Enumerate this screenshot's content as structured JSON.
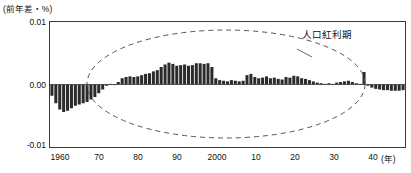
{
  "chart_data": {
    "type": "bar",
    "title": "",
    "subtitle": "",
    "ylabel": "(前年差・%)",
    "xlabel": "(年)",
    "ylim": [
      -0.01,
      0.01
    ],
    "xlim": [
      1960,
      2050
    ],
    "grid": false,
    "legend": null,
    "ytick_labels": [
      "0.01",
      "0.00",
      "-0.01"
    ],
    "ytick_values": [
      0.01,
      0.0,
      -0.01
    ],
    "xtick_labels": [
      "1960",
      "70",
      "80",
      "90",
      "2000",
      "10",
      "20",
      "30",
      "40"
    ],
    "xtick_values": [
      1960,
      1970,
      1980,
      1990,
      2000,
      2010,
      2020,
      2030,
      2040
    ],
    "bar_color": "#2b2b2b",
    "annotations": [
      {
        "text": "人口紅利期",
        "kind": "ellipse-callout",
        "description": "破線の楕円で囲まれた期間（およそ1970年代初頭から2030年頃まで）"
      }
    ],
    "x": [
      1960,
      1961,
      1962,
      1963,
      1964,
      1965,
      1966,
      1967,
      1968,
      1969,
      1970,
      1971,
      1972,
      1973,
      1974,
      1975,
      1976,
      1977,
      1978,
      1979,
      1980,
      1981,
      1982,
      1983,
      1984,
      1985,
      1986,
      1987,
      1988,
      1989,
      1990,
      1991,
      1992,
      1993,
      1994,
      1995,
      1996,
      1997,
      1998,
      1999,
      2000,
      2001,
      2002,
      2003,
      2004,
      2005,
      2006,
      2007,
      2008,
      2009,
      2010,
      2011,
      2012,
      2013,
      2014,
      2015,
      2016,
      2017,
      2018,
      2019,
      2020,
      2021,
      2022,
      2023,
      2024,
      2025,
      2026,
      2027,
      2028,
      2029,
      2030,
      2031,
      2032,
      2033,
      2034,
      2035,
      2036,
      2037,
      2038,
      2039,
      2040,
      2041,
      2042,
      2043,
      2044,
      2045,
      2046,
      2047,
      2048,
      2049,
      2050
    ],
    "values": [
      -0.0018,
      -0.003,
      -0.004,
      -0.0044,
      -0.0042,
      -0.0038,
      -0.0034,
      -0.0032,
      -0.003,
      -0.0028,
      -0.0024,
      -0.002,
      -0.0014,
      -0.0008,
      -0.0002,
      0.0001,
      -0.0001,
      0.0004,
      0.001,
      0.0012,
      0.0013,
      0.0012,
      0.0013,
      0.0015,
      0.0017,
      0.0018,
      0.0021,
      0.0023,
      0.0028,
      0.0032,
      0.0035,
      0.0033,
      0.003,
      0.0031,
      0.0032,
      0.003,
      0.0031,
      0.0034,
      0.0034,
      0.0033,
      0.0034,
      0.0028,
      0.001,
      0.0007,
      0.0006,
      0.0005,
      0.0007,
      0.0006,
      0.0005,
      0.0006,
      0.0015,
      0.0017,
      0.0012,
      0.001,
      0.0011,
      0.0013,
      0.001,
      0.0011,
      0.0009,
      0.0008,
      0.0012,
      0.0011,
      0.0014,
      0.0013,
      0.001,
      0.0009,
      0.0007,
      0.0005,
      0.0003,
      0.0002,
      0.0001,
      0.0002,
      0.0001,
      0.0003,
      0.0004,
      0.0005,
      0.0006,
      0.0004,
      0.0002,
      0.0001,
      0.002,
      -0.0002,
      -0.0005,
      -0.0007,
      -0.0008,
      -0.0009,
      -0.0009,
      -0.001,
      -0.001,
      -0.001,
      -0.0009
    ]
  },
  "axes": {
    "unit_label": "(前年差・%)",
    "x_unit_label": "(年)",
    "y_ticks": [
      {
        "label": "0.01"
      },
      {
        "label": "0.00"
      },
      {
        "label": "-0.01"
      }
    ],
    "x_ticks": [
      {
        "label": "1960"
      },
      {
        "label": "70"
      },
      {
        "label": "80"
      },
      {
        "label": "90"
      },
      {
        "label": "2000"
      },
      {
        "label": "10"
      },
      {
        "label": "20"
      },
      {
        "label": "30"
      },
      {
        "label": "40"
      }
    ]
  },
  "annotation": {
    "label": "人口紅利期"
  },
  "colors": {
    "bar": "#2b2b2b",
    "axis": "#3a3a3a",
    "text": "#111111",
    "dashed": "#555555"
  }
}
